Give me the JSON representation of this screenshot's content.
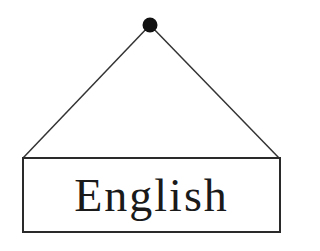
{
  "sign": {
    "label": "English"
  },
  "colors": {
    "ink": "#1a1a1a",
    "background": "#ffffff"
  },
  "icons": {
    "nail": "nail-icon"
  }
}
